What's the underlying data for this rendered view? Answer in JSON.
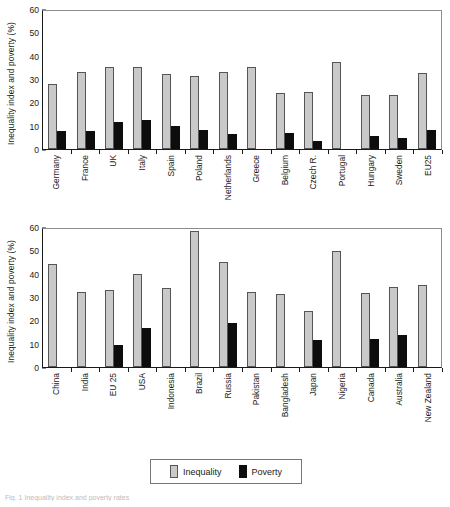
{
  "figure": {
    "caption": "Fig. 1 Inequality index and poverty rates"
  },
  "legend": {
    "items": [
      {
        "label": "Inequality",
        "color": "#c9c9c9",
        "key": "inequality"
      },
      {
        "label": "Poverty",
        "color": "#0d0d0d",
        "key": "poverty"
      }
    ]
  },
  "axis": {
    "ylabel": "Inequality index and poverty (%)",
    "yticks": [
      0,
      10,
      20,
      30,
      40,
      50,
      60
    ]
  },
  "chart_data": [
    {
      "type": "bar",
      "id": "eu-countries",
      "title": "",
      "xlabel": "",
      "ylabel": "Inequality index and poverty (%)",
      "ylim": [
        0,
        60
      ],
      "ytick_step": 10,
      "grid": false,
      "legend_position": "bottom",
      "categories": [
        "Germany",
        "France",
        "UK",
        "Italy",
        "Spain",
        "Poland",
        "Netherlands",
        "Greece",
        "Belgium",
        "Czech R.",
        "Portugal",
        "Hungary",
        "Sweden",
        "EU25"
      ],
      "series": [
        {
          "name": "Inequality",
          "color": "#c9c9c9",
          "values": [
            28.0,
            33.0,
            35.2,
            35.2,
            32.0,
            31.1,
            32.8,
            35.0,
            24.0,
            24.3,
            37.4,
            23.2,
            23.0,
            32.5
          ]
        },
        {
          "name": "Poverty",
          "color": "#0d0d0d",
          "values": [
            7.8,
            7.8,
            11.6,
            12.3,
            9.7,
            8.0,
            6.3,
            null,
            7.0,
            3.6,
            null,
            5.4,
            4.6,
            8.0
          ]
        }
      ]
    },
    {
      "type": "bar",
      "id": "world-countries",
      "title": "",
      "xlabel": "",
      "ylabel": "Inequality index and poverty (%)",
      "ylim": [
        0,
        60
      ],
      "ytick_step": 10,
      "grid": false,
      "legend_position": "bottom",
      "categories": [
        "China",
        "India",
        "EU 25",
        "USA",
        "Indonesia",
        "Brazil",
        "Russia",
        "Pakistan",
        "Bangladesh",
        "Japan",
        "Nigeria",
        "Canada",
        "Australia",
        "New Zealand"
      ],
      "series": [
        {
          "name": "Inequality",
          "color": "#c9c9c9",
          "values": [
            44.3,
            32.3,
            33.2,
            40.0,
            33.7,
            58.5,
            45.0,
            32.1,
            31.1,
            24.2,
            49.8,
            31.9,
            34.1,
            35.3
          ]
        },
        {
          "name": "Poverty",
          "color": "#0d0d0d",
          "values": [
            null,
            null,
            9.5,
            16.7,
            null,
            null,
            18.7,
            null,
            null,
            11.4,
            null,
            12.2,
            13.9,
            null
          ]
        }
      ]
    }
  ]
}
